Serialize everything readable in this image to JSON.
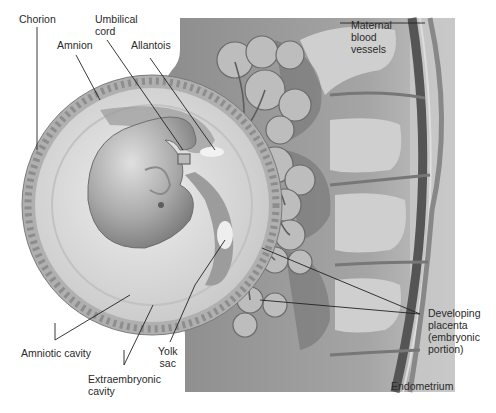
{
  "figure": {
    "labels": {
      "chorion": "Chorion",
      "umbilical_cord": "Umbilical\ncord",
      "amnion": "Amnion",
      "allantois": "Allantois",
      "maternal_blood_vessels": "Maternal\nblood\nvessels",
      "amniotic_cavity": "Amniotic cavity",
      "yolk_sac": "Yolk\nsac",
      "extraembryonic_cavity": "Extraembryonic\ncavity",
      "developing_placenta": "Developing\nplacenta\n(embryonic\nportion)",
      "endometrium": "Endometrium"
    },
    "colors": {
      "background": "#ffffff",
      "tissue": "#9a9a9a",
      "tissue_light": "#c8c8c8",
      "sac_fill": "#dcdcdc",
      "embryo": "#b5b5b5",
      "leader_line": "#222222",
      "text": "#2a2a2a"
    }
  }
}
